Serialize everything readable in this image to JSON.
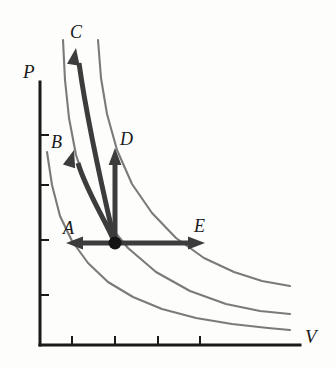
{
  "figure": {
    "background_color": "#fdfdfc"
  },
  "axes": {
    "x_label": "V",
    "y_label": "P",
    "axis_color": "#1a1a1a",
    "origin_x": 40,
    "origin_y": 345,
    "x_axis_end": 300,
    "y_axis_top": 82,
    "x_ticks": [
      72,
      115,
      158,
      200
    ],
    "y_ticks": [
      135,
      185,
      240,
      295
    ],
    "tick_length": 9
  },
  "chart_data": {
    "type": "line",
    "title": "",
    "xlabel": "V",
    "ylabel": "P",
    "grid": false,
    "legend": "none",
    "annotations": [
      {
        "label": "A",
        "x": 66,
        "y": 243,
        "direction": "left",
        "description": "isothermal compression"
      },
      {
        "label": "B",
        "x": 74,
        "y": 150,
        "direction": "up-left",
        "description": "curved process up and left"
      },
      {
        "label": "C",
        "x": 76,
        "y": 48,
        "direction": "up",
        "description": "curved process steeply up"
      },
      {
        "label": "D",
        "x": 116,
        "y": 148,
        "direction": "up",
        "description": "isochoric pressure increase"
      },
      {
        "label": "E",
        "x": 205,
        "y": 243,
        "direction": "right",
        "description": "isothermal expansion"
      }
    ],
    "state_point": {
      "x": 115,
      "y": 243,
      "label": ""
    },
    "series": [
      {
        "name": "isotherm-low",
        "color": "#7a7a7a",
        "points": [
          [
            47,
            152
          ],
          [
            52,
            185
          ],
          [
            60,
            216
          ],
          [
            72,
            241
          ],
          [
            88,
            263
          ],
          [
            108,
            282
          ],
          [
            133,
            297
          ],
          [
            162,
            309
          ],
          [
            196,
            318
          ],
          [
            232,
            324
          ],
          [
            268,
            328
          ],
          [
            290,
            330
          ]
        ]
      },
      {
        "name": "isotherm-mid",
        "color": "#7a7a7a",
        "points": [
          [
            63,
            40
          ],
          [
            65,
            80
          ],
          [
            69,
            118
          ],
          [
            76,
            155
          ],
          [
            88,
            190
          ],
          [
            105,
            220
          ],
          [
            128,
            248
          ],
          [
            156,
            272
          ],
          [
            190,
            291
          ],
          [
            226,
            304
          ],
          [
            260,
            311
          ],
          [
            290,
            314
          ]
        ]
      },
      {
        "name": "isotherm-high",
        "color": "#7a7a7a",
        "points": [
          [
            98,
            40
          ],
          [
            101,
            78
          ],
          [
            107,
            114
          ],
          [
            117,
            150
          ],
          [
            132,
            184
          ],
          [
            152,
            213
          ],
          [
            176,
            238
          ],
          [
            204,
            258
          ],
          [
            234,
            272
          ],
          [
            262,
            281
          ],
          [
            290,
            286
          ]
        ]
      }
    ]
  },
  "arrows": {
    "color": "#3c3c3c",
    "stroke_width": 5,
    "items": [
      {
        "name": "arrow-A",
        "label": "A",
        "path": "M 115 243 L 73 243",
        "head_at": [
          66,
          243
        ],
        "head_angle": 180
      },
      {
        "name": "arrow-B",
        "label": "B",
        "path": "M 115 243 C 104 218 86 190 78 163",
        "head_at": [
          74,
          150
        ],
        "head_angle": -73
      },
      {
        "name": "arrow-C",
        "label": "C",
        "path": "M 115 243 C 105 200 88 128 79 63",
        "head_at": [
          76,
          48
        ],
        "head_angle": -81
      },
      {
        "name": "arrow-D",
        "label": "D",
        "path": "M 115 243 L 115 161",
        "head_at": [
          115,
          148
        ],
        "head_angle": -90
      },
      {
        "name": "arrow-E",
        "label": "E",
        "path": "M 115 243 L 197 243",
        "head_at": [
          205,
          243
        ],
        "head_angle": 0
      }
    ]
  },
  "labels": {
    "P": "P",
    "V": "V",
    "A": "A",
    "B": "B",
    "C": "C",
    "D": "D",
    "E": "E"
  }
}
